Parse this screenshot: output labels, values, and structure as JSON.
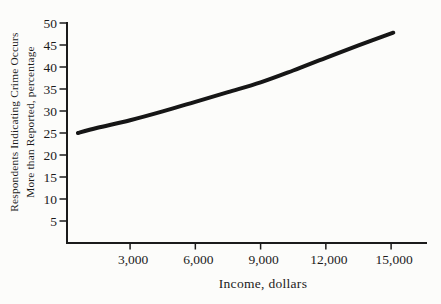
{
  "figure": {
    "background": "#fcfcfa",
    "ink_color": "#1b1b1b",
    "curve_color": "#161616"
  },
  "chart_data": {
    "type": "line",
    "title": "",
    "xlabel": "Income, dollars",
    "ylabel_line1": "Respondents Indicating Crime Occurs",
    "ylabel_line2": "More than Reported, percentage",
    "xlim": [
      100,
      16650
    ],
    "ylim": [
      0,
      50
    ],
    "grid": false,
    "legend": "none",
    "xticks": [
      {
        "value": 3000,
        "label": "3,000"
      },
      {
        "value": 6000,
        "label": "6,000"
      },
      {
        "value": 9000,
        "label": "9,000"
      },
      {
        "value": 12000,
        "label": "12,000"
      },
      {
        "value": 15000,
        "label": "15,000"
      }
    ],
    "yticks": [
      {
        "value": 5,
        "label": "5"
      },
      {
        "value": 10,
        "label": "10"
      },
      {
        "value": 15,
        "label": "15"
      },
      {
        "value": 20,
        "label": "20"
      },
      {
        "value": 25,
        "label": "25"
      },
      {
        "value": 30,
        "label": "30"
      },
      {
        "value": 35,
        "label": "35"
      },
      {
        "value": 40,
        "label": "40"
      },
      {
        "value": 45,
        "label": "45"
      },
      {
        "value": 50,
        "label": "50"
      }
    ],
    "series": [
      {
        "name": "percent-saying-crime-underreported",
        "x": [
          600,
          1500,
          3000,
          4500,
          6000,
          7500,
          9000,
          10500,
          12000,
          13500,
          15100
        ],
        "y": [
          25.0,
          26.2,
          27.9,
          29.9,
          32.1,
          34.3,
          36.5,
          39.2,
          42.1,
          44.9,
          47.8
        ]
      }
    ]
  }
}
